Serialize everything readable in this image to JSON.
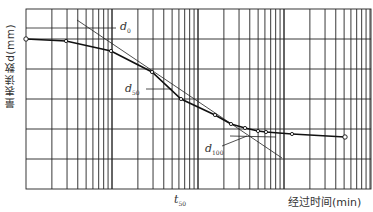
{
  "chart_data": {
    "type": "line",
    "title": "",
    "xlabel": "经过时间(min)",
    "ylabel": "量表读数d(mm)",
    "x_scale": "log",
    "grid": true,
    "annotations": [
      {
        "text": "d",
        "sub": "0",
        "description": "initial (zero) reading, intersection of upper tangent"
      },
      {
        "text": "d",
        "sub": "50",
        "description": "50% consolidation reading"
      },
      {
        "text": "d",
        "sub": "100",
        "description": "100% primary consolidation reading, intersection of tangents"
      },
      {
        "text": "t",
        "sub": "50",
        "description": "time at 50% consolidation on x axis"
      }
    ],
    "series": [
      {
        "name": "dial reading curve",
        "points_px": [
          [
            26,
            39
          ],
          [
            66,
            41
          ],
          [
            111,
            51
          ],
          [
            152,
            72
          ],
          [
            181,
            99
          ],
          [
            215,
            115
          ],
          [
            231,
            124
          ],
          [
            245,
            128
          ],
          [
            258,
            131
          ],
          [
            266,
            132
          ],
          [
            292,
            134
          ],
          [
            345,
            137
          ]
        ]
      }
    ],
    "tangents": [
      {
        "name": "steep-tangent",
        "from_px": [
          77,
          20
        ],
        "to_px": [
          282,
          158
        ]
      },
      {
        "name": "asymptote-tangent",
        "from_px": [
          230,
          136
        ],
        "to_px": [
          276,
          137
        ]
      }
    ]
  },
  "labels": {
    "ylabel": "量表读数d(mm)",
    "xlabel": "经过时间(min)",
    "d0_main": "d",
    "d0_sub": "0",
    "d50_main": "d",
    "d50_sub": "50",
    "d100_main": "d",
    "d100_sub": "100",
    "t50_main": "t",
    "t50_sub": "50"
  }
}
